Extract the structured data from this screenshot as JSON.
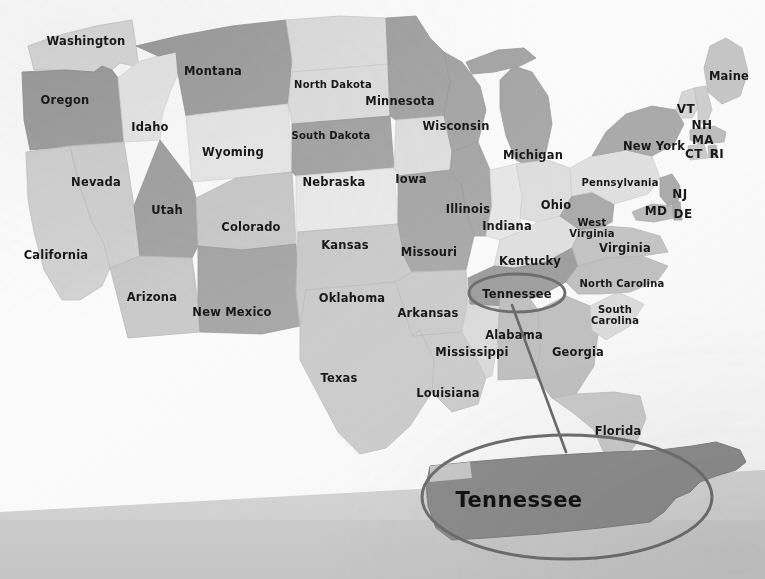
{
  "scene": {
    "title": "United States map with Tennessee highlighted",
    "description": "Photograph of a printed gray-scale US states map; Tennessee is circled and shown enlarged in an oval callout at lower right.",
    "background_color": "#fdfdfd",
    "desk_band_color": "#c9c9c9"
  },
  "map": {
    "highlight": {
      "state": "Tennessee",
      "callout_label": "Tennessee",
      "ellipse_stroke_color": "#6e6e6e",
      "leader_line_color": "#6a6a6a"
    },
    "palette": {
      "dark_gray": "#9b9b9b",
      "mid_gray": "#bdbdbd",
      "light_gray": "#d9d9d9",
      "pale_gray": "#e6e6e6",
      "label_color": "#18181a",
      "water_color": "#fbfbfb"
    },
    "states": [
      {
        "name": "Washington",
        "label": "Washington",
        "x": 86,
        "y": 41,
        "tone": "light"
      },
      {
        "name": "Oregon",
        "label": "Oregon",
        "x": 65,
        "y": 100,
        "tone": "dark"
      },
      {
        "name": "California",
        "label": "California",
        "x": 56,
        "y": 255,
        "tone": "mid"
      },
      {
        "name": "Nevada",
        "label": "Nevada",
        "x": 96,
        "y": 182,
        "tone": "mid"
      },
      {
        "name": "Idaho",
        "label": "Idaho",
        "x": 150,
        "y": 127,
        "tone": "pale"
      },
      {
        "name": "Montana",
        "label": "Montana",
        "x": 213,
        "y": 71,
        "tone": "dark"
      },
      {
        "name": "Wyoming",
        "label": "Wyoming",
        "x": 233,
        "y": 152,
        "tone": "pale"
      },
      {
        "name": "Utah",
        "label": "Utah",
        "x": 167,
        "y": 210,
        "tone": "dark"
      },
      {
        "name": "Arizona",
        "label": "Arizona",
        "x": 152,
        "y": 297,
        "tone": "mid"
      },
      {
        "name": "Colorado",
        "label": "Colorado",
        "x": 251,
        "y": 227,
        "tone": "mid"
      },
      {
        "name": "New Mexico",
        "label": "New Mexico",
        "x": 232,
        "y": 312,
        "tone": "dark"
      },
      {
        "name": "North Dakota",
        "label": "North Dakota",
        "x": 333,
        "y": 85,
        "tone": "light"
      },
      {
        "name": "South Dakota",
        "label": "South Dakota",
        "x": 331,
        "y": 136,
        "tone": "light"
      },
      {
        "name": "Nebraska",
        "label": "Nebraska",
        "x": 334,
        "y": 182,
        "tone": "dark"
      },
      {
        "name": "Kansas",
        "label": "Kansas",
        "x": 345,
        "y": 245,
        "tone": "pale"
      },
      {
        "name": "Oklahoma",
        "label": "Oklahoma",
        "x": 352,
        "y": 298,
        "tone": "mid"
      },
      {
        "name": "Texas",
        "label": "Texas",
        "x": 339,
        "y": 378,
        "tone": "mid"
      },
      {
        "name": "Minnesota",
        "label": "Minnesota",
        "x": 400,
        "y": 101,
        "tone": "dark"
      },
      {
        "name": "Iowa",
        "label": "Iowa",
        "x": 411,
        "y": 179,
        "tone": "light"
      },
      {
        "name": "Missouri",
        "label": "Missouri",
        "x": 429,
        "y": 252,
        "tone": "dark"
      },
      {
        "name": "Arkansas",
        "label": "Arkansas",
        "x": 428,
        "y": 313,
        "tone": "mid"
      },
      {
        "name": "Louisiana",
        "label": "Louisiana",
        "x": 448,
        "y": 393,
        "tone": "mid"
      },
      {
        "name": "Wisconsin",
        "label": "Wisconsin",
        "x": 456,
        "y": 126,
        "tone": "dark"
      },
      {
        "name": "Illinois",
        "label": "Illinois",
        "x": 468,
        "y": 209,
        "tone": "dark"
      },
      {
        "name": "Mississippi",
        "label": "Mississippi",
        "x": 472,
        "y": 352,
        "tone": "light"
      },
      {
        "name": "Michigan",
        "label": "Michigan",
        "x": 533,
        "y": 155,
        "tone": "dark"
      },
      {
        "name": "Indiana",
        "label": "Indiana",
        "x": 507,
        "y": 226,
        "tone": "pale"
      },
      {
        "name": "Ohio",
        "label": "Ohio",
        "x": 556,
        "y": 205,
        "tone": "light"
      },
      {
        "name": "Kentucky",
        "label": "Kentucky",
        "x": 530,
        "y": 261,
        "tone": "light"
      },
      {
        "name": "Tennessee",
        "label": "Tennessee",
        "x": 517,
        "y": 294,
        "tone": "dark"
      },
      {
        "name": "Alabama",
        "label": "Alabama",
        "x": 514,
        "y": 335,
        "tone": "mid"
      },
      {
        "name": "Georgia",
        "label": "Georgia",
        "x": 578,
        "y": 352,
        "tone": "mid"
      },
      {
        "name": "Florida",
        "label": "Florida",
        "x": 618,
        "y": 431,
        "tone": "mid"
      },
      {
        "name": "South Carolina",
        "label": "South Carolina",
        "x": 615,
        "y": 315,
        "tone": "light"
      },
      {
        "name": "North Carolina",
        "label": "North Carolina",
        "x": 622,
        "y": 284,
        "tone": "mid"
      },
      {
        "name": "Virginia",
        "label": "Virginia",
        "x": 625,
        "y": 248,
        "tone": "mid"
      },
      {
        "name": "West Virginia",
        "label": "West Virginia",
        "x": 592,
        "y": 228,
        "tone": "dark"
      },
      {
        "name": "Pennsylvania",
        "label": "Pennsylvania",
        "x": 620,
        "y": 183,
        "tone": "light"
      },
      {
        "name": "New York",
        "label": "New York",
        "x": 654,
        "y": 146,
        "tone": "dark"
      },
      {
        "name": "Maine",
        "label": "Maine",
        "x": 729,
        "y": 76,
        "tone": "mid"
      }
    ],
    "abbreviations": [
      {
        "name": "Vermont",
        "label": "VT",
        "x": 686,
        "y": 109
      },
      {
        "name": "New Hampshire",
        "label": "NH",
        "x": 702,
        "y": 125
      },
      {
        "name": "Massachusetts",
        "label": "MA",
        "x": 703,
        "y": 140
      },
      {
        "name": "Connecticut",
        "label": "CT",
        "x": 694,
        "y": 154
      },
      {
        "name": "Rhode Island",
        "label": "RI",
        "x": 717,
        "y": 154
      },
      {
        "name": "New Jersey",
        "label": "NJ",
        "x": 680,
        "y": 194
      },
      {
        "name": "Maryland",
        "label": "MD",
        "x": 656,
        "y": 211
      },
      {
        "name": "Delaware",
        "label": "DE",
        "x": 683,
        "y": 214
      }
    ]
  },
  "callout": {
    "inset_state": "Tennessee",
    "inset_label": "Tennessee",
    "inset_fill": "#8c8c8c",
    "ellipse_center": {
      "x": 567,
      "y": 497
    },
    "ellipse_radius": {
      "rx": 145,
      "ry": 62
    },
    "source_ellipse_center": {
      "x": 517,
      "y": 293
    },
    "source_ellipse_radius": {
      "rx": 48,
      "ry": 19
    }
  }
}
